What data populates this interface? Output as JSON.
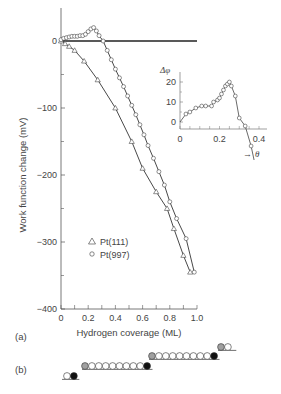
{
  "chart_data": [
    {
      "panel": "(a)",
      "type": "scatter",
      "title": "",
      "xlabel": "Hydrogen coverage (ML)",
      "ylabel": "Work function change (mV)",
      "xlim": [
        0,
        1.0
      ],
      "ylim": [
        -400,
        50
      ],
      "xticks": [
        "0",
        "0.2",
        "0.4",
        "0.6",
        "0.8",
        "1.0"
      ],
      "yticks": [
        "0",
        "−100",
        "−200",
        "−300",
        "−400"
      ],
      "grid": false,
      "legend": {
        "position": "lower-left inside",
        "entries": [
          "Pt(111)",
          "Pt(997)"
        ]
      },
      "reference_line": {
        "y": 0,
        "from_x": 0,
        "to_x": 1.0
      },
      "series": [
        {
          "name": "Pt(111)",
          "marker": "triangle",
          "x": [
            0.0,
            0.03,
            0.06,
            0.1,
            0.17,
            0.27,
            0.4,
            0.52,
            0.6,
            0.7,
            0.78,
            0.83,
            0.9,
            0.95
          ],
          "y": [
            0,
            -4,
            -8,
            -14,
            -30,
            -58,
            -100,
            -150,
            -190,
            -225,
            -250,
            -280,
            -320,
            -345
          ]
        },
        {
          "name": "Pt(997)",
          "marker": "circle",
          "x": [
            0.0,
            0.02,
            0.04,
            0.06,
            0.08,
            0.1,
            0.12,
            0.14,
            0.16,
            0.18,
            0.2,
            0.22,
            0.24,
            0.26,
            0.28,
            0.31,
            0.34,
            0.37,
            0.4,
            0.43,
            0.46,
            0.49,
            0.52,
            0.55,
            0.58,
            0.61,
            0.64,
            0.68,
            0.72,
            0.76,
            0.8,
            0.85,
            0.92,
            0.98
          ],
          "y": [
            2,
            4,
            5,
            6,
            7,
            7,
            7,
            8,
            8,
            10,
            14,
            18,
            20,
            15,
            8,
            0,
            -14,
            -28,
            -42,
            -55,
            -68,
            -82,
            -96,
            -110,
            -125,
            -140,
            -156,
            -175,
            -195,
            -215,
            -240,
            -265,
            -295,
            -345
          ]
        }
      ]
    },
    {
      "panel": "(a) inset",
      "type": "line",
      "xlabel": "→ θ",
      "ylabel": "Δφ",
      "xlim": [
        0,
        0.45
      ],
      "ylim": [
        -12,
        25
      ],
      "xticks": [
        "0",
        "0.2",
        "0.4"
      ],
      "yticks": [
        "0",
        "10",
        "20"
      ],
      "series": [
        {
          "name": "Pt(997) difference",
          "marker": "circle",
          "x": [
            0.0,
            0.03,
            0.05,
            0.08,
            0.11,
            0.13,
            0.16,
            0.17,
            0.19,
            0.2,
            0.21,
            0.22,
            0.23,
            0.24,
            0.25,
            0.26,
            0.28,
            0.3,
            0.33,
            0.36
          ],
          "y": [
            0,
            4,
            5,
            7,
            8,
            8,
            8,
            10,
            11,
            12,
            14,
            16,
            18,
            19,
            20,
            18,
            13,
            2,
            -2,
            -12
          ]
        }
      ]
    }
  ],
  "figure": {
    "panel_a_label": "(a)",
    "panel_b_label": "(b)",
    "main": {
      "xlabel": "Hydrogen coverage (ML)",
      "ylabel": "Work function change (mV)",
      "xticks": [
        "0",
        "0.2",
        "0.4",
        "0.6",
        "0.8",
        "1.0"
      ],
      "yticks": [
        "0",
        "−100",
        "−200",
        "−300",
        "−400"
      ],
      "legend": [
        {
          "symbol": "△",
          "label": "Pt(111)"
        },
        {
          "symbol": "○",
          "label": "Pt(997)"
        }
      ]
    },
    "inset": {
      "ylabel": "Δφ",
      "xlabel_arrow": "→",
      "xlabel_symbol": "θ",
      "xticks": [
        "0",
        "0.2",
        "0.4"
      ],
      "yticks": [
        "0",
        "10",
        "20"
      ]
    },
    "panel_b": {
      "description": "Stepped surface schematic: terraces of open atoms, grey atom at upper step edge, black atom at lower step corner",
      "colors": {
        "open": "#ffffff",
        "grey": "#a0a0a0",
        "black": "#111111"
      },
      "terraces": [
        {
          "atoms": [
            "open",
            "black"
          ]
        },
        {
          "atoms": [
            "grey",
            "open",
            "open",
            "open",
            "open",
            "open",
            "open",
            "open",
            "open",
            "black"
          ]
        },
        {
          "atoms": [
            "grey",
            "open",
            "open",
            "open",
            "open",
            "open",
            "open",
            "open",
            "open",
            "black"
          ]
        },
        {
          "atoms": [
            "grey",
            "open"
          ]
        }
      ]
    }
  }
}
